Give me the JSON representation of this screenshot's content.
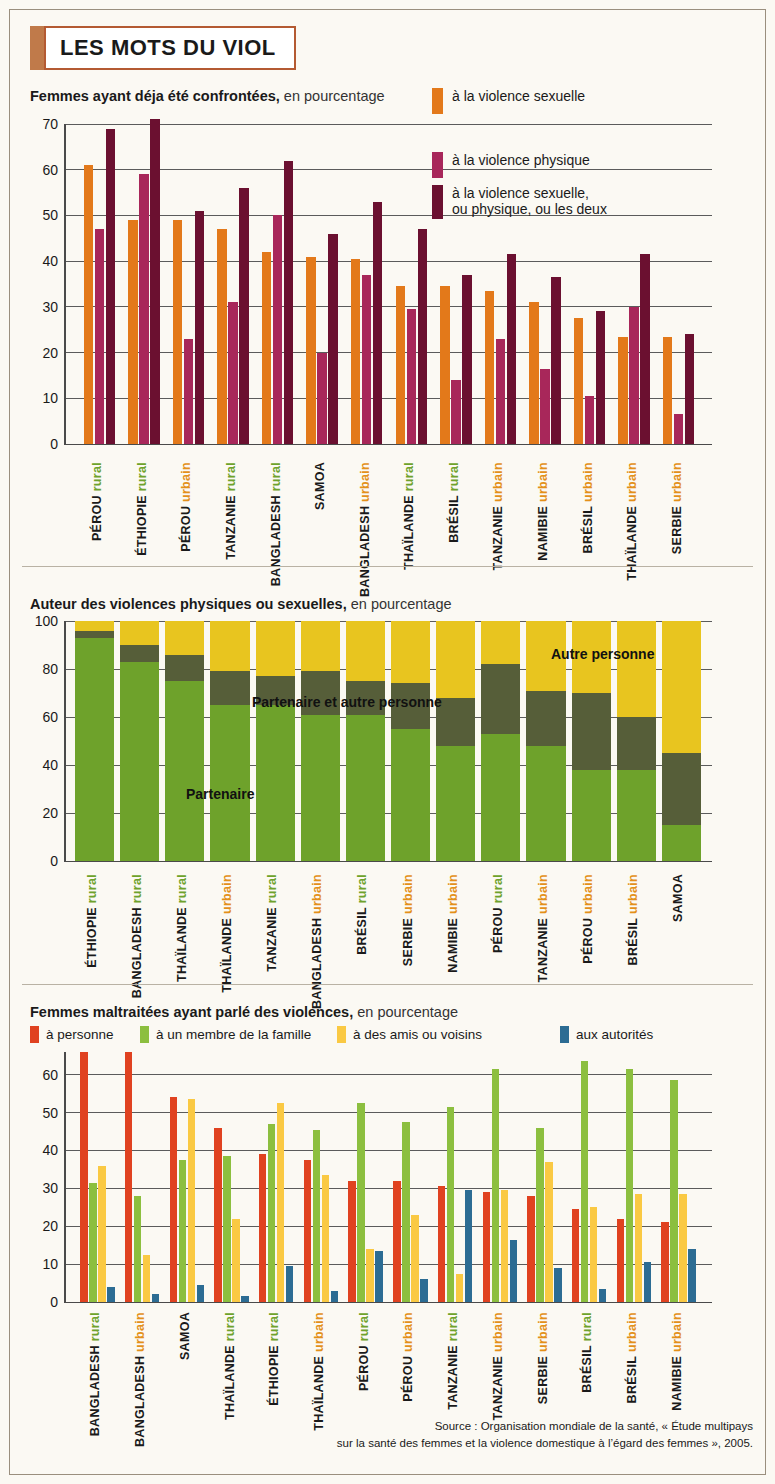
{
  "title": "LES MOTS DU VIOL",
  "source": {
    "line1": "Source : Organisation mondiale de la santé, « Étude multipays",
    "line2": "sur la santé des femmes et la violence domestique à l’égard des femmes », 2005."
  },
  "colors": {
    "orange": "#E3791A",
    "crimson": "#A8275A",
    "maroon": "#6B1030",
    "green": "#6EA22B",
    "olive": "#565E39",
    "yellow": "#E8C51F",
    "red3": "#E04220",
    "green3": "#8CBF3F",
    "yellow3": "#FAC943",
    "blue3": "#2C6C93",
    "label_rural": "#6EA22B",
    "label_urbain": "#E3901A",
    "frame": "#B45A32"
  },
  "chart1": {
    "title_bold": "Femmes ayant déja été confrontées,",
    "title_rest": " en pourcentage",
    "legend": [
      {
        "label": "à la violence sexuelle",
        "color_key": "orange"
      },
      {
        "label": "à la violence physique",
        "color_key": "crimson"
      },
      {
        "label": "à la violence sexuelle,\nou physique, ou les deux",
        "color_key": "maroon"
      }
    ],
    "legend_line3_a": "à la violence sexuelle,",
    "legend_line3_b": "ou physique, ou les deux"
  },
  "chart2": {
    "title_bold": "Auteur des violences physiques ou sexuelles,",
    "title_rest": " en pourcentage",
    "inline_labels": {
      "partenaire": "Partenaire",
      "partenaire_autre": "Partenaire et autre personne",
      "autre": "Autre personne"
    }
  },
  "chart3": {
    "title_bold": "Femmes maltraitées ayant parlé des violences,",
    "title_rest": " en pourcentage",
    "legend": [
      {
        "label": "à personne",
        "color_key": "red3"
      },
      {
        "label": "à un membre de la famille",
        "color_key": "green3"
      },
      {
        "label": "à des amis ou voisins",
        "color_key": "yellow3"
      },
      {
        "label": "aux autorités",
        "color_key": "blue3"
      }
    ]
  },
  "chart_data": [
    {
      "type": "bar",
      "id": "chart1",
      "title": "Femmes ayant déja été confrontées, en pourcentage",
      "xlabel": "",
      "ylabel": "",
      "ylim": [
        0,
        70
      ],
      "yticks": [
        0,
        10,
        20,
        30,
        40,
        50,
        60,
        70
      ],
      "grid": true,
      "legend_position": "top-right",
      "categories": [
        {
          "place": "PÉROU",
          "zone": "rural"
        },
        {
          "place": "ÉTHIOPIE",
          "zone": "rural"
        },
        {
          "place": "PÉROU",
          "zone": "urbain"
        },
        {
          "place": "TANZANIE",
          "zone": "rural"
        },
        {
          "place": "BANGLADESH",
          "zone": "rural"
        },
        {
          "place": "SAMOA",
          "zone": ""
        },
        {
          "place": "BANGLADESH",
          "zone": "urbain"
        },
        {
          "place": "THAÏLANDE",
          "zone": "rural"
        },
        {
          "place": "BRÉSIL",
          "zone": "rural"
        },
        {
          "place": "TANZANIE",
          "zone": "urbain"
        },
        {
          "place": "NAMIBIE",
          "zone": "urbain"
        },
        {
          "place": "BRÉSIL",
          "zone": "urbain"
        },
        {
          "place": "THAÏLANDE",
          "zone": "urbain"
        },
        {
          "place": "SERBIE",
          "zone": "urbain"
        }
      ],
      "series": [
        {
          "name": "à la violence sexuelle",
          "color": "#E3791A",
          "values": [
            61,
            49,
            49,
            47,
            42,
            41,
            40.5,
            34.5,
            34.5,
            33.5,
            31,
            27.5,
            23.5,
            23.5
          ]
        },
        {
          "name": "à la violence physique",
          "color": "#A8275A",
          "values": [
            47,
            59,
            23,
            31,
            50,
            20,
            37,
            29.5,
            14,
            23,
            16.5,
            10.5,
            30,
            6.5
          ]
        },
        {
          "name": "à la violence sexuelle, ou physique, ou les deux",
          "color": "#6B1030",
          "values": [
            69,
            71,
            51,
            56,
            62,
            46,
            53,
            47,
            37,
            41.5,
            36.5,
            29,
            41.5,
            24
          ]
        }
      ]
    },
    {
      "type": "bar",
      "id": "chart2",
      "stacked": true,
      "title": "Auteur des violences physiques ou sexuelles, en pourcentage",
      "ylim": [
        0,
        100
      ],
      "yticks": [
        0,
        20,
        40,
        60,
        80,
        100
      ],
      "grid": true,
      "categories": [
        {
          "place": "ÉTHIOPIE",
          "zone": "rural"
        },
        {
          "place": "BANGLADESH",
          "zone": "rural"
        },
        {
          "place": "THAÏLANDE",
          "zone": "rural"
        },
        {
          "place": "THAÏLANDE",
          "zone": "urbain"
        },
        {
          "place": "TANZANIE",
          "zone": "rural"
        },
        {
          "place": "BANGLADESH",
          "zone": "urbain"
        },
        {
          "place": "BRÉSIL",
          "zone": "rural"
        },
        {
          "place": "SERBIE",
          "zone": "urbain"
        },
        {
          "place": "NAMIBIE",
          "zone": "urbain"
        },
        {
          "place": "PÉROU",
          "zone": "rural"
        },
        {
          "place": "TANZANIE",
          "zone": "urbain"
        },
        {
          "place": "PÉROU",
          "zone": "urbain"
        },
        {
          "place": "BRÉSIL",
          "zone": "urbain"
        },
        {
          "place": "SAMOA",
          "zone": ""
        }
      ],
      "series": [
        {
          "name": "Partenaire",
          "color": "#6EA22B",
          "values": [
            93,
            83,
            75,
            65,
            65,
            61,
            61,
            55,
            48,
            53,
            48,
            38,
            38,
            15
          ]
        },
        {
          "name": "Partenaire et autre personne",
          "color": "#565E39",
          "values": [
            3,
            7,
            11,
            14,
            12,
            18,
            14,
            19,
            20,
            29,
            23,
            32,
            22,
            30
          ]
        },
        {
          "name": "Autre personne",
          "color": "#E8C51F",
          "values": [
            4,
            10,
            14,
            21,
            23,
            21,
            25,
            26,
            32,
            18,
            29,
            30,
            40,
            55
          ]
        }
      ]
    },
    {
      "type": "bar",
      "id": "chart3",
      "title": "Femmes maltraitées ayant parlé des violences, en pourcentage",
      "ylim": [
        0,
        66
      ],
      "yticks": [
        0,
        10,
        20,
        30,
        40,
        50,
        60
      ],
      "grid": true,
      "legend_position": "top",
      "categories": [
        {
          "place": "BANGLADESH",
          "zone": "rural"
        },
        {
          "place": "BANGLADESH",
          "zone": "urbain"
        },
        {
          "place": "SAMOA",
          "zone": ""
        },
        {
          "place": "THAÏLANDE",
          "zone": "rural"
        },
        {
          "place": "ÉTHIOPIE",
          "zone": "rural"
        },
        {
          "place": "THAÏLANDE",
          "zone": "urbain"
        },
        {
          "place": "PÉROU",
          "zone": "rural"
        },
        {
          "place": "PÉROU",
          "zone": "urbain"
        },
        {
          "place": "TANZANIE",
          "zone": "rural"
        },
        {
          "place": "TANZANIE",
          "zone": "urbain"
        },
        {
          "place": "SERBIE",
          "zone": "urbain"
        },
        {
          "place": "BRÉSIL",
          "zone": "rural"
        },
        {
          "place": "BRÉSIL",
          "zone": "urbain"
        },
        {
          "place": "NAMIBIE",
          "zone": "urbain"
        }
      ],
      "series": [
        {
          "name": "à personne",
          "color": "#E04220",
          "values": [
            66,
            66,
            54,
            46,
            39,
            37.5,
            32,
            32,
            30.5,
            29,
            28,
            24.5,
            22,
            21
          ]
        },
        {
          "name": "à un membre de la famille",
          "color": "#8CBF3F",
          "values": [
            31.5,
            28,
            37.5,
            38.5,
            47,
            45.5,
            52.5,
            47.5,
            51.5,
            61.5,
            46,
            63.5,
            61.5,
            58.5
          ]
        },
        {
          "name": "à des amis ou voisins",
          "color": "#FAC943",
          "values": [
            36,
            12.5,
            53.5,
            22,
            52.5,
            33.5,
            14,
            23,
            7.5,
            29.5,
            37,
            25,
            28.5,
            28.5
          ]
        },
        {
          "name": "aux autorités",
          "color": "#2C6C93",
          "values": [
            4,
            2,
            4.5,
            1.5,
            9.5,
            3,
            13.5,
            6,
            29.5,
            16.5,
            9,
            3.5,
            10.5,
            14
          ]
        }
      ]
    }
  ]
}
